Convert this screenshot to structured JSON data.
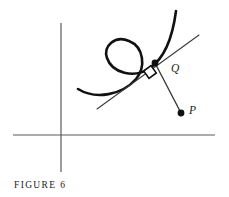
{
  "figure": {
    "caption": "FIGURE 6",
    "background_color": "#ffffff",
    "width": 229,
    "height": 197
  },
  "labels": {
    "tangent_point": "Q",
    "external_point": "P"
  },
  "colors": {
    "curve": "#111111",
    "axis": "#5a5a5a",
    "line": "#3a3a3a",
    "point": "#111111",
    "text": "#1a1a1a"
  },
  "geometry": {
    "axes": {
      "x_axis": {
        "x1": 13,
        "y1": 135,
        "x2": 215,
        "y2": 135
      },
      "y_axis": {
        "x1": 61,
        "y1": 23,
        "x2": 61,
        "y2": 172
      }
    },
    "curve": {
      "description": "looped curve with a self-intersecting curl",
      "path": "M 78 89 C 96 100, 122 95, 136 79 C 146 67, 144 47, 129 41 C 115 35, 103 46, 107 58 C 112 73, 134 79, 150 68 C 166 57, 173 34, 176 11"
    },
    "tangent_line": {
      "x1": 97,
      "y1": 109,
      "x2": 199,
      "y2": 35
    },
    "normal_line": {
      "x1": 155,
      "y1": 63,
      "x2": 181,
      "y2": 113
    },
    "tangent_point": {
      "x": 155,
      "y": 63,
      "r": 3.4
    },
    "external_point": {
      "x": 181,
      "y": 113,
      "r": 3.4
    },
    "right_angle_marker": {
      "cx": 150,
      "cy": 72,
      "size": 9,
      "rotation": -36
    }
  }
}
